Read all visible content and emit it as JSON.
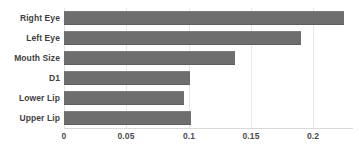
{
  "chart_data": {
    "type": "bar",
    "orientation": "horizontal",
    "title": "",
    "subtitle": "",
    "xlabel": "",
    "ylabel": "",
    "categories": [
      "Right Eye",
      "Left Eye",
      "Mouth Size",
      "D1",
      "Lower Lip",
      "Upper Lip"
    ],
    "values": [
      0.225,
      0.19,
      0.137,
      0.101,
      0.096,
      0.102
    ],
    "series": [
      {
        "name": "Importance",
        "values": [
          0.225,
          0.19,
          0.137,
          0.101,
          0.096,
          0.102
        ]
      }
    ],
    "xlim": [
      0,
      0.225
    ],
    "xticks": [
      0,
      0.05,
      0.1,
      0.15,
      0.2
    ],
    "xtick_labels": [
      "0",
      "0.05",
      "0.1",
      "0.15",
      "0.2"
    ],
    "grid": "vertical-only",
    "legend": "none",
    "bar_color": "#6e6e6e",
    "grid_color": "#e8e8e8",
    "axis_color": "#d9d9d9",
    "label_color": "#3f3f3f",
    "background": "#ffffff"
  }
}
